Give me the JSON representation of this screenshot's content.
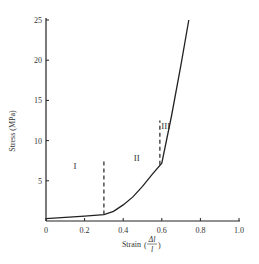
{
  "chart_data": {
    "type": "line",
    "title": "",
    "xlabel": "Strain (Δl / l)",
    "ylabel": "Stress (MPa)",
    "xlim": [
      0,
      1.0
    ],
    "ylim": [
      0,
      25
    ],
    "x_ticks": [
      "0",
      "0.2",
      "0.4",
      "0.6",
      "0.8",
      "1.0"
    ],
    "y_ticks": [
      "5",
      "10",
      "15",
      "20",
      "25"
    ],
    "grid": false,
    "legend": null,
    "series": [
      {
        "name": "stress-strain curve",
        "x": [
          0.0,
          0.1,
          0.2,
          0.3,
          0.35,
          0.4,
          0.45,
          0.5,
          0.55,
          0.6,
          0.65,
          0.7,
          0.74
        ],
        "y": [
          0.3,
          0.45,
          0.6,
          0.8,
          1.2,
          2.0,
          3.0,
          4.3,
          5.8,
          7.2,
          13.0,
          19.5,
          25.0
        ]
      }
    ],
    "annotations": [
      {
        "type": "region-label",
        "text": "I",
        "x": 0.15,
        "y": 6.5
      },
      {
        "type": "region-label",
        "text": "II",
        "x": 0.47,
        "y": 7.5
      },
      {
        "type": "region-label",
        "text": "III",
        "x": 0.62,
        "y": 11.5
      },
      {
        "type": "dashed-vline",
        "x": 0.3,
        "y_from": 0.8,
        "y_to": 7.5
      },
      {
        "type": "dashed-vline",
        "x": 0.59,
        "y_from": 7.0,
        "y_to": 12.5
      }
    ]
  },
  "labels": {
    "xlabel_prefix": "Strain",
    "xlabel_num": "Δl",
    "xlabel_den": "l",
    "ylabel": "Stress (MPa)",
    "region_I": "I",
    "region_II": "II",
    "region_III": "III"
  }
}
